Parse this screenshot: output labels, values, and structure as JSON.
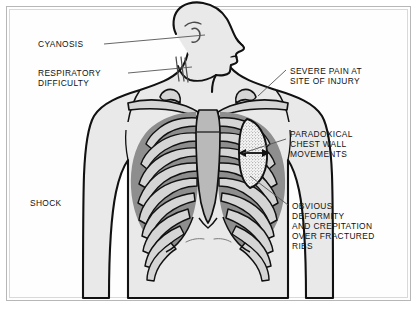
{
  "figure": {
    "frame_color": "#b7b7b7",
    "background_color": "#ffffff"
  },
  "palette": {
    "outline": "#111111",
    "skin_fill": "#e9e9e9",
    "bone_fill": "#d5d5d5",
    "intercostal_fill": "#8e8e8e",
    "sternum_fill": "#b9b9b9",
    "stipple_fill": "#f2f2f2",
    "leader_line": "#555555",
    "text": "#111111"
  },
  "labels": [
    {
      "id": "cyanosis",
      "text": "CYANOSIS",
      "lines": [
        "CYANOSIS"
      ]
    },
    {
      "id": "respiratory-difficulty",
      "text": "RESPIRATORY DIFFICULTY",
      "lines": [
        "RESPIRATORY",
        "DIFFICULTY"
      ]
    },
    {
      "id": "shock",
      "text": "SHOCK",
      "lines": [
        "SHOCK"
      ]
    },
    {
      "id": "severe-pain",
      "text": "SEVERE PAIN AT SITE OF INJURY",
      "lines": [
        "SEVERE PAIN AT",
        "SITE OF INJURY"
      ]
    },
    {
      "id": "paradoxical-movement",
      "text": "PARADOXICAL CHEST WALL MOVEMENTS",
      "lines": [
        "PARADOXICAL",
        "CHEST WALL",
        "MOVEMENTS"
      ]
    },
    {
      "id": "obvious-deformity",
      "text": "OBVIOUS DEFORMITY AND CREPITATION OVER FRACTURED RIBS",
      "lines": [
        "OBVIOUS",
        "DEFORMITY",
        "AND CREPITATION",
        "OVER FRACTURED",
        "RIBS"
      ]
    }
  ],
  "label_text": {
    "cyanosis_l1": "CYANOSIS",
    "respiratory_l1": "RESPIRATORY",
    "respiratory_l2": "DIFFICULTY",
    "shock_l1": "SHOCK",
    "severe_pain_l1": "SEVERE PAIN AT",
    "severe_pain_l2": "SITE OF INJURY",
    "paradoxical_l1": "PARADOXICAL",
    "paradoxical_l2": "CHEST WALL",
    "paradoxical_l3": "MOVEMENTS",
    "deformity_l1": "OBVIOUS",
    "deformity_l2": "DEFORMITY",
    "deformity_l3": "AND CREPITATION",
    "deformity_l4": "OVER FRACTURED",
    "deformity_l5": "RIBS"
  },
  "anatomy": {
    "head": "head-profile-turned-right",
    "neck": "neck-with-sternocleidomastoid",
    "clavicles": "clavicle-pair",
    "sternum": "sternum-with-xiphoid",
    "ribs_per_side": 9,
    "flail_segment": "stippled-oval-left-lateral-chest",
    "flail_arrow": "double-headed-horizontal-arrow"
  }
}
